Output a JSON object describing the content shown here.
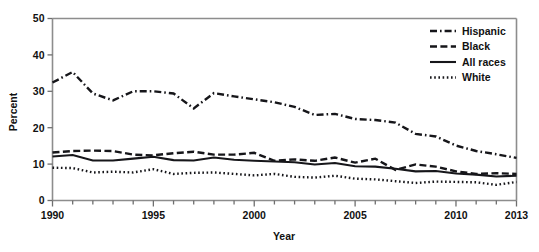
{
  "chart_data": {
    "type": "line",
    "title": "",
    "xlabel": "Year",
    "ylabel": "Percent",
    "xlim": [
      1990,
      2013
    ],
    "ylim": [
      0,
      50
    ],
    "grid": false,
    "legend_position": "top-right",
    "x": [
      1990,
      1991,
      1992,
      1993,
      1994,
      1995,
      1996,
      1997,
      1998,
      1999,
      2000,
      2001,
      2002,
      2003,
      2004,
      2005,
      2006,
      2007,
      2008,
      2009,
      2010,
      2011,
      2012,
      2013
    ],
    "xtick_values": [
      1990,
      1995,
      2000,
      2005,
      2010,
      2013
    ],
    "xtick_labels": [
      "1990",
      "1995",
      "2000",
      "2005",
      "2010",
      "2013"
    ],
    "ytick_values": [
      0,
      10,
      20,
      30,
      40,
      50
    ],
    "ytick_labels": [
      "0",
      "10",
      "20",
      "30",
      "40",
      "50"
    ],
    "series": [
      {
        "name": "Hispanic",
        "style": "dashdot",
        "values": [
          32.4,
          35.3,
          29.4,
          27.5,
          30.0,
          30.0,
          29.4,
          25.3,
          29.5,
          28.6,
          27.8,
          27.0,
          25.7,
          23.5,
          23.8,
          22.4,
          22.1,
          21.4,
          18.3,
          17.6,
          15.1,
          13.6,
          12.7,
          11.7
        ]
      },
      {
        "name": "Black",
        "style": "dashed",
        "values": [
          13.2,
          13.6,
          13.7,
          13.6,
          12.6,
          12.4,
          13.0,
          13.4,
          12.6,
          12.6,
          13.1,
          10.9,
          11.3,
          10.9,
          11.8,
          10.4,
          11.5,
          8.4,
          9.9,
          9.3,
          8.0,
          7.3,
          7.5,
          7.3
        ]
      },
      {
        "name": "All races",
        "style": "solid",
        "values": [
          12.1,
          12.5,
          11.0,
          11.0,
          11.5,
          12.0,
          11.1,
          11.0,
          11.8,
          11.2,
          10.9,
          10.7,
          10.5,
          9.9,
          10.3,
          9.4,
          9.3,
          8.7,
          8.0,
          8.1,
          7.4,
          7.1,
          6.6,
          6.8
        ]
      },
      {
        "name": "White",
        "style": "dotted",
        "values": [
          9.0,
          8.9,
          7.7,
          7.9,
          7.7,
          8.6,
          7.3,
          7.6,
          7.7,
          7.3,
          6.9,
          7.3,
          6.5,
          6.3,
          6.8,
          6.0,
          5.8,
          5.3,
          4.8,
          5.2,
          5.1,
          5.0,
          4.3,
          5.1
        ]
      }
    ]
  },
  "legend": {
    "items": [
      {
        "label": "Hispanic",
        "style": "dashdot"
      },
      {
        "label": "Black",
        "style": "dashed"
      },
      {
        "label": "All races",
        "style": "solid"
      },
      {
        "label": "White",
        "style": "dotted"
      }
    ]
  }
}
